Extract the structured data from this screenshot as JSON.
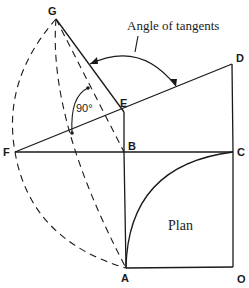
{
  "diagram": {
    "labels": {
      "annotation": "Angle of tangents",
      "angle": "90°",
      "plan": "Plan"
    },
    "points": {
      "G": "G",
      "D": "D",
      "E": "E",
      "B": "B",
      "C": "C",
      "F": "F",
      "A": "A",
      "O": "O"
    },
    "colors": {
      "line": "#1a1a1a",
      "background": "#ffffff"
    }
  }
}
